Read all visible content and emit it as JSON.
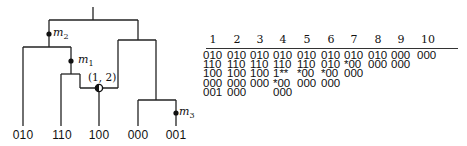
{
  "tree": {
    "leaves": [
      {
        "label": "010",
        "x": 23
      },
      {
        "label": "110",
        "x": 62
      },
      {
        "label": "100",
        "x": 99
      },
      {
        "label": "000",
        "x": 138
      },
      {
        "label": "001",
        "x": 176
      }
    ],
    "mutations": [
      {
        "name": "m",
        "sub": "2",
        "x": 49,
        "y": 34
      },
      {
        "name": "m",
        "sub": "1",
        "x": 71,
        "y": 61
      },
      {
        "name": "m",
        "sub": "3",
        "x": 176,
        "y": 113
      }
    ],
    "recombination": {
      "label": "(1, 2)",
      "x": 99,
      "y": 88
    }
  },
  "table": {
    "headers": [
      "1",
      "2",
      "3",
      "4",
      "5",
      "6",
      "7",
      "8",
      "9",
      "10"
    ],
    "columns": [
      [
        "010",
        "110",
        "100",
        "000",
        "001"
      ],
      [
        "010",
        "110",
        "100",
        "000",
        "000"
      ],
      [
        "010",
        "110",
        "100",
        "000"
      ],
      [
        "010",
        "110",
        "1**",
        "*00",
        "000"
      ],
      [
        "010",
        "110",
        "*00",
        "000"
      ],
      [
        "010",
        "010",
        "*00",
        "000"
      ],
      [
        "010",
        "*00",
        "000"
      ],
      [
        "010",
        "000"
      ],
      [
        "000",
        "000"
      ],
      [
        "000"
      ]
    ]
  }
}
